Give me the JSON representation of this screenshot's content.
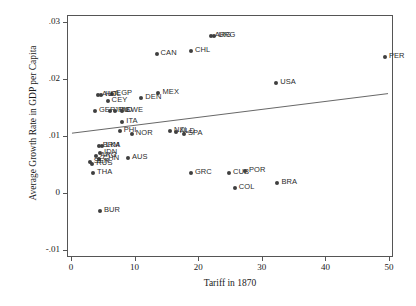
{
  "chart_data": {
    "type": "scatter",
    "title": "",
    "xlabel": "Tariff in 1870",
    "ylabel": "Average Growth Rate in GDP per Capita",
    "xlim": [
      0,
      50
    ],
    "ylim": [
      -0.01,
      0.03
    ],
    "xticks": [
      "0",
      "10",
      "20",
      "30",
      "40",
      "50"
    ],
    "xtick_values": [
      0,
      10,
      20,
      30,
      40,
      50
    ],
    "yticks": [
      "-.01",
      "0",
      ".01",
      ".02",
      ".03"
    ],
    "ytick_values": [
      -0.01,
      0,
      0.01,
      0.02,
      0.03
    ],
    "grid": false,
    "legend": "none",
    "point_label_key": "country-code",
    "points": [
      {
        "label": "ARG",
        "x": 21.8,
        "y": 0.0277,
        "side": "right"
      },
      {
        "label": "URG",
        "x": 22.4,
        "y": 0.0277,
        "side": "right"
      },
      {
        "label": "CHL",
        "x": 18.7,
        "y": 0.0251,
        "side": "right"
      },
      {
        "label": "CAN",
        "x": 13.3,
        "y": 0.0245,
        "side": "right"
      },
      {
        "label": "PER",
        "x": 49.2,
        "y": 0.024,
        "side": "right"
      },
      {
        "label": "USA",
        "x": 32.1,
        "y": 0.0194,
        "side": "right"
      },
      {
        "label": "MEX",
        "x": 13.6,
        "y": 0.0178,
        "side": "right"
      },
      {
        "label": "EGP",
        "x": 6.3,
        "y": 0.0176,
        "side": "right"
      },
      {
        "label": "AUT",
        "x": 4.1,
        "y": 0.0173,
        "side": "right"
      },
      {
        "label": "HOL",
        "x": 4.6,
        "y": 0.0173,
        "side": "right"
      },
      {
        "label": "DEN",
        "x": 10.9,
        "y": 0.0168,
        "side": "right"
      },
      {
        "label": "CEY",
        "x": 5.6,
        "y": 0.0164,
        "side": "right"
      },
      {
        "label": "GER",
        "x": 3.6,
        "y": 0.0146,
        "side": "right"
      },
      {
        "label": "JPN",
        "x": 6.0,
        "y": 0.0146,
        "side": "right"
      },
      {
        "label": "IND",
        "x": 6.8,
        "y": 0.0146,
        "side": "right"
      },
      {
        "label": "SWE",
        "x": 7.8,
        "y": 0.0146,
        "side": "right"
      },
      {
        "label": "ITA",
        "x": 7.9,
        "y": 0.0126,
        "side": "right"
      },
      {
        "label": "PHI",
        "x": 7.5,
        "y": 0.011,
        "side": "right"
      },
      {
        "label": "NOR",
        "x": 9.4,
        "y": 0.0106,
        "side": "right"
      },
      {
        "label": "NZL",
        "x": 15.4,
        "y": 0.011,
        "side": "right"
      },
      {
        "label": "NLD",
        "x": 16.3,
        "y": 0.0108,
        "side": "right"
      },
      {
        "label": "SPA",
        "x": 17.6,
        "y": 0.0105,
        "side": "right"
      },
      {
        "label": "BRM",
        "x": 4.2,
        "y": 0.0085,
        "side": "right"
      },
      {
        "label": "LKA",
        "x": 4.7,
        "y": 0.0085,
        "side": "right"
      },
      {
        "label": "IDN",
        "x": 4.4,
        "y": 0.0072,
        "side": "right"
      },
      {
        "label": "ARG2",
        "x": 3.8,
        "y": 0.0066,
        "side": "right"
      },
      {
        "label": "CHN",
        "x": 4.2,
        "y": 0.0062,
        "side": "right"
      },
      {
        "label": "AUS",
        "x": 8.8,
        "y": 0.0063,
        "side": "right"
      },
      {
        "label": "SER",
        "x": 2.8,
        "y": 0.0057,
        "side": "right"
      },
      {
        "label": "RUS",
        "x": 3.2,
        "y": 0.0053,
        "side": "right"
      },
      {
        "label": "THA",
        "x": 3.3,
        "y": 0.0036,
        "side": "right"
      },
      {
        "label": "GRC",
        "x": 18.7,
        "y": 0.0036,
        "side": "right"
      },
      {
        "label": "CUB",
        "x": 24.7,
        "y": 0.0036,
        "side": "right"
      },
      {
        "label": "POR",
        "x": 27.2,
        "y": 0.004,
        "side": "right"
      },
      {
        "label": "COL",
        "x": 25.6,
        "y": 0.0011,
        "side": "right"
      },
      {
        "label": "BRA",
        "x": 32.3,
        "y": 0.0019,
        "side": "right"
      },
      {
        "label": "BUR",
        "x": 4.4,
        "y": -0.003,
        "side": "right"
      }
    ],
    "trendline": {
      "name": "fitted-regression-line",
      "x_start": 0,
      "y_start": 0.0105,
      "x_end": 50,
      "y_end": 0.0175
    }
  }
}
